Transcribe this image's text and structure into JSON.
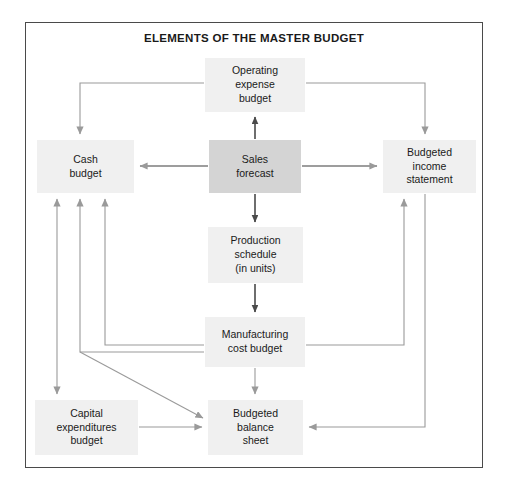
{
  "diagram": {
    "title": "ELEMENTS OF THE MASTER BUDGET",
    "type": "flowchart",
    "frame": {
      "border_color": "#4a4a4a"
    },
    "colors": {
      "node_fill_light": "#f0f0f0",
      "node_fill_highlight": "#d4d4d4",
      "arrow_light": "#9a9a9a",
      "arrow_dark": "#4a4a4a",
      "text": "#1a1a1a",
      "background": "#ffffff"
    },
    "nodes": [
      {
        "id": "operating-expense-budget",
        "label": "Operating expense budget",
        "lines": [
          "Operating",
          "expense",
          "budget"
        ],
        "emphasis": "normal",
        "x": 205,
        "y": 58,
        "w": 100,
        "h": 54
      },
      {
        "id": "cash-budget",
        "label": "Cash budget",
        "lines": [
          "Cash",
          "budget"
        ],
        "emphasis": "normal",
        "x": 37,
        "y": 140,
        "w": 97,
        "h": 53
      },
      {
        "id": "sales-forecast",
        "label": "Sales forecast",
        "lines": [
          "Sales",
          "forecast"
        ],
        "emphasis": "highlight",
        "x": 209,
        "y": 140,
        "w": 92,
        "h": 53
      },
      {
        "id": "budgeted-income-statement",
        "label": "Budgeted income statement",
        "lines": [
          "Budgeted",
          "income",
          "statement"
        ],
        "emphasis": "normal",
        "x": 383,
        "y": 140,
        "w": 93,
        "h": 53
      },
      {
        "id": "production-schedule",
        "label": "Production schedule (in units)",
        "lines": [
          "Production",
          "schedule",
          "(in units)"
        ],
        "emphasis": "normal",
        "x": 208,
        "y": 227,
        "w": 95,
        "h": 56
      },
      {
        "id": "manufacturing-cost-budget",
        "label": "Manufacturing cost budget",
        "lines": [
          "Manufacturing",
          "cost budget"
        ],
        "emphasis": "normal",
        "x": 205,
        "y": 317,
        "w": 100,
        "h": 50
      },
      {
        "id": "capital-expenditures-budget",
        "label": "Capital expenditures budget",
        "lines": [
          "Capital",
          "expenditures",
          "budget"
        ],
        "emphasis": "normal",
        "x": 35,
        "y": 400,
        "w": 103,
        "h": 55
      },
      {
        "id": "budgeted-balance-sheet",
        "label": "Budgeted balance sheet",
        "lines": [
          "Budgeted",
          "balance",
          "sheet"
        ],
        "emphasis": "normal",
        "x": 208,
        "y": 400,
        "w": 95,
        "h": 55
      }
    ],
    "edges": [
      {
        "id": "sales-to-operating",
        "from": "sales-forecast",
        "to": "operating-expense-budget",
        "style": "dark"
      },
      {
        "id": "sales-to-cash",
        "from": "sales-forecast",
        "to": "cash-budget",
        "style": "dark"
      },
      {
        "id": "sales-to-income",
        "from": "sales-forecast",
        "to": "budgeted-income-statement",
        "style": "dark"
      },
      {
        "id": "sales-to-production",
        "from": "sales-forecast",
        "to": "production-schedule",
        "style": "dark"
      },
      {
        "id": "production-to-manufacturing",
        "from": "production-schedule",
        "to": "manufacturing-cost-budget",
        "style": "dark"
      },
      {
        "id": "operating-to-cash",
        "from": "operating-expense-budget",
        "to": "cash-budget",
        "style": "light"
      },
      {
        "id": "operating-to-income",
        "from": "operating-expense-budget",
        "to": "budgeted-income-statement",
        "style": "light"
      },
      {
        "id": "manufacturing-to-cash",
        "from": "manufacturing-cost-budget",
        "to": "cash-budget",
        "style": "light"
      },
      {
        "id": "manufacturing-to-cash-2",
        "from": "manufacturing-cost-budget",
        "to": "cash-budget",
        "style": "light"
      },
      {
        "id": "manufacturing-to-balance",
        "from": "manufacturing-cost-budget",
        "to": "budgeted-balance-sheet",
        "style": "light"
      },
      {
        "id": "manufacturing-to-income",
        "from": "manufacturing-cost-budget",
        "to": "budgeted-income-statement",
        "style": "light"
      },
      {
        "id": "manufacturing-down-to-balance",
        "from": "manufacturing-cost-budget",
        "to": "budgeted-balance-sheet",
        "style": "light"
      },
      {
        "id": "cash-capital-bidirectional",
        "from": "cash-budget",
        "to": "capital-expenditures-budget",
        "style": "light",
        "bidirectional": true
      },
      {
        "id": "capital-to-balance",
        "from": "capital-expenditures-budget",
        "to": "budgeted-balance-sheet",
        "style": "light"
      },
      {
        "id": "income-to-balance",
        "from": "budgeted-income-statement",
        "to": "budgeted-balance-sheet",
        "style": "light"
      }
    ]
  }
}
